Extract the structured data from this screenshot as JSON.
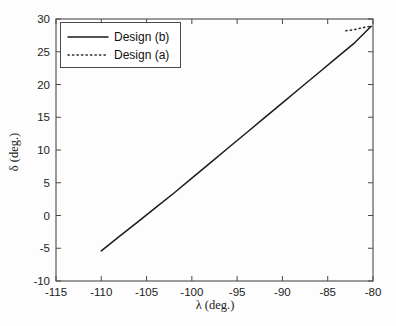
{
  "chart_data": {
    "type": "line",
    "title": "",
    "xlabel": "λ (deg.)",
    "ylabel": "δ (deg.)",
    "xlim": [
      -115,
      -80
    ],
    "ylim": [
      -10,
      30
    ],
    "xticks": [
      "-115",
      "-110",
      "-105",
      "-100",
      "-95",
      "-90",
      "-85",
      "-80"
    ],
    "xtick_values": [
      -115,
      -110,
      -105,
      -100,
      -95,
      -90,
      -85,
      -80
    ],
    "yticks": [
      "-10",
      "-5",
      "0",
      "5",
      "10",
      "15",
      "20",
      "25",
      "30"
    ],
    "ytick_values": [
      -10,
      -5,
      0,
      5,
      10,
      15,
      20,
      25,
      30
    ],
    "grid": false,
    "legend_position": "upper left",
    "series": [
      {
        "name": "Design (b)",
        "style": "solid",
        "color": "#1b1b1b",
        "x": [
          -110.0,
          -108.0,
          -106.0,
          -104.0,
          -102.0,
          -100.0,
          -98.0,
          -96.0,
          -94.0,
          -92.0,
          -90.0,
          -88.0,
          -86.0,
          -84.0,
          -82.0,
          -80.2
        ],
        "y": [
          -5.4,
          -3.2,
          -1.0,
          1.2,
          3.4,
          5.7,
          8.0,
          10.3,
          12.6,
          14.9,
          17.2,
          19.5,
          21.8,
          24.1,
          26.4,
          28.9
        ]
      },
      {
        "name": "Design (a)",
        "style": "dotted",
        "color": "#2a2a2a",
        "x": [
          -83.0,
          -82.0,
          -81.0,
          -80.3
        ],
        "y": [
          28.2,
          28.4,
          28.7,
          28.9
        ]
      }
    ]
  },
  "legend": {
    "entries": [
      {
        "label": "Design (b)",
        "style": "solid"
      },
      {
        "label": "Design (a)",
        "style": "dotted"
      }
    ]
  },
  "axes": {
    "x_axis_title": "λ (deg.)",
    "y_axis_title": "δ (deg.)"
  }
}
